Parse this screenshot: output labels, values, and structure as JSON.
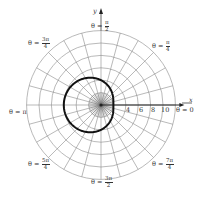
{
  "figure": {
    "type": "polar_graph",
    "center_px": [
      101,
      105
    ],
    "px_per_unit": 6.2,
    "grid": {
      "circle_radii": [
        2,
        4,
        6,
        8,
        10,
        12
      ],
      "radial_line_step_deg": 15,
      "color": "#8a8a8a"
    },
    "curve": {
      "equation": "r = 4 - 2cos(θ)",
      "a": 4,
      "b": -2,
      "color": "#111111",
      "stroke_width": 2
    },
    "axes": {
      "x_label": "x",
      "y_label": "y",
      "x_ticks": [
        "4",
        "6",
        "8",
        "10"
      ]
    },
    "angle_labels": {
      "theta_0": {
        "prefix": "θ = ",
        "value": "0"
      },
      "theta_pi_4": {
        "prefix": "θ = ",
        "num": "π",
        "den": "4"
      },
      "theta_pi_2": {
        "prefix": "θ = ",
        "num": "π",
        "den": "2"
      },
      "theta_3pi_4": {
        "prefix": "θ = ",
        "num": "3π",
        "den": "4"
      },
      "theta_pi": {
        "prefix": "θ = ",
        "value": "π"
      },
      "theta_5pi_4": {
        "prefix": "θ = ",
        "num": "5π",
        "den": "4"
      },
      "theta_3pi_2": {
        "prefix": "θ = ",
        "num": "3π",
        "den": "2"
      },
      "theta_7pi_4": {
        "prefix": "θ = ",
        "num": "7π",
        "den": "4"
      }
    }
  }
}
